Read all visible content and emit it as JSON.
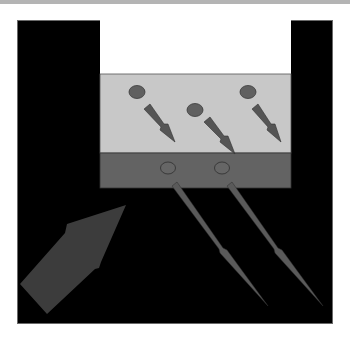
{
  "colors": {
    "background": "#ffffff",
    "topbar": "#b4b4b4",
    "frame": "#000000",
    "upper_region": "#ffffff",
    "light_layer": "#c8c8c8",
    "dark_layer": "#636363",
    "particle": "#606060",
    "particle_outline": "#3a3a3a",
    "incident_arrow": "#3c3c3c",
    "emission_arrow": "#5a5a5a"
  },
  "diagram": {
    "layers": [
      {
        "name": "upper-region",
        "x": 100,
        "y": 20,
        "w": 191,
        "h": 54
      },
      {
        "name": "light-layer",
        "x": 100,
        "y": 74,
        "w": 191,
        "h": 79
      },
      {
        "name": "dark-layer",
        "x": 100,
        "y": 153,
        "w": 191,
        "h": 35
      }
    ],
    "light_layer_particles": [
      {
        "cx": 137,
        "cy": 92,
        "arrow_from": [
          147,
          106
        ],
        "arrow_to": [
          175,
          142
        ]
      },
      {
        "cx": 195,
        "cy": 110,
        "arrow_from": [
          207,
          120
        ],
        "arrow_to": [
          235,
          154
        ]
      },
      {
        "cx": 248,
        "cy": 92,
        "arrow_from": [
          256,
          106
        ],
        "arrow_to": [
          281,
          142
        ]
      }
    ],
    "dark_layer_particles": [
      {
        "cx": 168,
        "cy": 168,
        "arrow_from": [
          175,
          184
        ],
        "arrow_to": [
          268,
          306
        ]
      },
      {
        "cx": 222,
        "cy": 168,
        "arrow_from": [
          230,
          184
        ],
        "arrow_to": [
          323,
          306
        ]
      }
    ],
    "incident_arrow": {
      "tail": [
        30,
        300
      ],
      "head": [
        126,
        205
      ]
    }
  }
}
